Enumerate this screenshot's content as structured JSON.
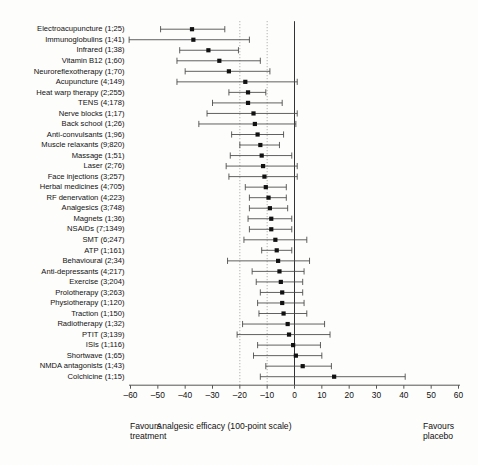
{
  "chart_data": {
    "type": "forest",
    "title": "",
    "xlabel": "Analgesic efficacy (100-point scale)",
    "ylabel": "",
    "xlim": [
      -60,
      60
    ],
    "xticks": [
      -60,
      -50,
      -40,
      -30,
      -20,
      -10,
      0,
      10,
      20,
      30,
      40,
      50,
      60
    ],
    "xticklabels": [
      "–60",
      "–50",
      "–40",
      "–30",
      "–20",
      "–10",
      "0",
      "10",
      "20",
      "30",
      "40",
      "50",
      "60"
    ],
    "grid": false,
    "reference_lines": [
      {
        "value": 0,
        "style": "solid",
        "label": "no-effect-line"
      },
      {
        "value": -10,
        "style": "dotted",
        "label": "minimal-important-difference-line"
      },
      {
        "value": -20,
        "style": "dotted",
        "label": "moderate-difference-line"
      }
    ],
    "axis_footnote_left": "Favours\ntreatment",
    "axis_footnote_right": "Favours\nplacebo",
    "marker": "square",
    "rows": [
      {
        "label": "Electroacupuncture (1;25)",
        "name": "Electroacupuncture",
        "trials": 1,
        "patients": 25,
        "estimate": -37.5,
        "ci_low": -49.0,
        "ci_high": -25.5
      },
      {
        "label": "Immunoglobulins (1;41)",
        "name": "Immunoglobulins",
        "trials": 1,
        "patients": 41,
        "estimate": -37.0,
        "ci_low": -60.5,
        "ci_high": -16.5
      },
      {
        "label": "Infrared (1;38)",
        "name": "Infrared",
        "trials": 1,
        "patients": 38,
        "estimate": -31.5,
        "ci_low": -42.0,
        "ci_high": -20.5
      },
      {
        "label": "Vitamin B12 (1;60)",
        "name": "Vitamin B12",
        "trials": 1,
        "patients": 60,
        "estimate": -27.5,
        "ci_low": -43.0,
        "ci_high": -12.5
      },
      {
        "label": "Neuroreflexotherapy (1;70)",
        "name": "Neuroreflexotherapy",
        "trials": 1,
        "patients": 70,
        "estimate": -24.0,
        "ci_low": -40.0,
        "ci_high": -9.0
      },
      {
        "label": "Acupuncture (4;149)",
        "name": "Acupuncture",
        "trials": 4,
        "patients": 149,
        "estimate": -18.0,
        "ci_low": -43.0,
        "ci_high": 1.0
      },
      {
        "label": "Heat warp therapy (2;255)",
        "name": "Heat warp therapy",
        "trials": 2,
        "patients": 255,
        "estimate": -17.0,
        "ci_low": -24.0,
        "ci_high": -10.5
      },
      {
        "label": "TENS (4;178)",
        "name": "TENS",
        "trials": 4,
        "patients": 178,
        "estimate": -17.0,
        "ci_low": -30.0,
        "ci_high": -4.5
      },
      {
        "label": "Nerve blocks (1;17)",
        "name": "Nerve blocks",
        "trials": 1,
        "patients": 17,
        "estimate": -15.0,
        "ci_low": -32.0,
        "ci_high": 1.0
      },
      {
        "label": "Back school (1;26)",
        "name": "Back school",
        "trials": 1,
        "patients": 26,
        "estimate": -14.5,
        "ci_low": -35.0,
        "ci_high": 0.5
      },
      {
        "label": "Anti-convulsants (1;96)",
        "name": "Anti-convulsants",
        "trials": 1,
        "patients": 96,
        "estimate": -13.5,
        "ci_low": -23.0,
        "ci_high": -4.0
      },
      {
        "label": "Muscle relaxants (9;820)",
        "name": "Muscle relaxants",
        "trials": 9,
        "patients": 820,
        "estimate": -12.5,
        "ci_low": -20.0,
        "ci_high": -5.5
      },
      {
        "label": "Massage (1;51)",
        "name": "Massage",
        "trials": 1,
        "patients": 51,
        "estimate": -12.0,
        "ci_low": -23.5,
        "ci_high": -1.0
      },
      {
        "label": "Laser (2;76)",
        "name": "Laser",
        "trials": 2,
        "patients": 76,
        "estimate": -11.5,
        "ci_low": -25.0,
        "ci_high": 1.0
      },
      {
        "label": "Face injections (3;257)",
        "name": "Face injections",
        "trials": 3,
        "patients": 257,
        "estimate": -11.0,
        "ci_low": -24.0,
        "ci_high": 1.0
      },
      {
        "label": "Herbal medicines (4;705)",
        "name": "Herbal medicines",
        "trials": 4,
        "patients": 705,
        "estimate": -10.5,
        "ci_low": -18.0,
        "ci_high": -3.0
      },
      {
        "label": "RF denervation (4;223)",
        "name": "RF denervation",
        "trials": 4,
        "patients": 223,
        "estimate": -9.5,
        "ci_low": -16.5,
        "ci_high": -3.0
      },
      {
        "label": "Analgesics (3;748)",
        "name": "Analgesics",
        "trials": 3,
        "patients": 748,
        "estimate": -9.0,
        "ci_low": -16.5,
        "ci_high": -2.5
      },
      {
        "label": "Magnets (1;36)",
        "name": "Magnets",
        "trials": 1,
        "patients": 36,
        "estimate": -8.5,
        "ci_low": -17.0,
        "ci_high": -1.0
      },
      {
        "label": "NSAIDs (7;1349)",
        "name": "NSAIDs",
        "trials": 7,
        "patients": 1349,
        "estimate": -8.5,
        "ci_low": -16.5,
        "ci_high": -1.0
      },
      {
        "label": "SMT (6;247)",
        "name": "SMT",
        "trials": 6,
        "patients": 247,
        "estimate": -7.0,
        "ci_low": -18.5,
        "ci_high": 4.5
      },
      {
        "label": "ATP (1;161)",
        "name": "ATP",
        "trials": 1,
        "patients": 161,
        "estimate": -6.5,
        "ci_low": -12.0,
        "ci_high": -1.0
      },
      {
        "label": "Behavioural (2;34)",
        "name": "Behavioural",
        "trials": 2,
        "patients": 34,
        "estimate": -6.0,
        "ci_low": -24.5,
        "ci_high": 5.5
      },
      {
        "label": "Anti-depressants (4;217)",
        "name": "Anti-depressants",
        "trials": 4,
        "patients": 217,
        "estimate": -5.5,
        "ci_low": -15.5,
        "ci_high": 3.5
      },
      {
        "label": "Exercise (3;204)",
        "name": "Exercise",
        "trials": 3,
        "patients": 204,
        "estimate": -5.0,
        "ci_low": -14.0,
        "ci_high": 3.0
      },
      {
        "label": "Prolotherapy (3;263)",
        "name": "Prolotherapy",
        "trials": 3,
        "patients": 263,
        "estimate": -4.5,
        "ci_low": -12.5,
        "ci_high": 3.0
      },
      {
        "label": "Physiotherapy (1;120)",
        "name": "Physiotherapy",
        "trials": 1,
        "patients": 120,
        "estimate": -4.5,
        "ci_low": -13.5,
        "ci_high": 3.5
      },
      {
        "label": "Traction (1;150)",
        "name": "Traction",
        "trials": 1,
        "patients": 150,
        "estimate": -4.0,
        "ci_low": -13.0,
        "ci_high": 4.5
      },
      {
        "label": "Radiotherapy (1;32)",
        "name": "Radiotherapy",
        "trials": 1,
        "patients": 32,
        "estimate": -2.5,
        "ci_low": -19.0,
        "ci_high": 11.0
      },
      {
        "label": "PTIT (3;139)",
        "name": "PTIT",
        "trials": 3,
        "patients": 139,
        "estimate": -2.0,
        "ci_low": -21.0,
        "ci_high": 13.0
      },
      {
        "label": "ISIs (1;116)",
        "name": "ISIs",
        "trials": 1,
        "patients": 116,
        "estimate": -0.5,
        "ci_low": -13.5,
        "ci_high": 9.5
      },
      {
        "label": "Shortwave (1;65)",
        "name": "Shortwave",
        "trials": 1,
        "patients": 65,
        "estimate": 0.5,
        "ci_low": -15.0,
        "ci_high": 10.0
      },
      {
        "label": "NMDA antagonists (1;43)",
        "name": "NMDA antagonists",
        "trials": 1,
        "patients": 43,
        "estimate": 3.0,
        "ci_low": -10.5,
        "ci_high": 13.5
      },
      {
        "label": "Colchicine (1;15)",
        "name": "Colchicine",
        "trials": 1,
        "patients": 15,
        "estimate": 14.5,
        "ci_low": -12.5,
        "ci_high": 40.5
      }
    ]
  }
}
